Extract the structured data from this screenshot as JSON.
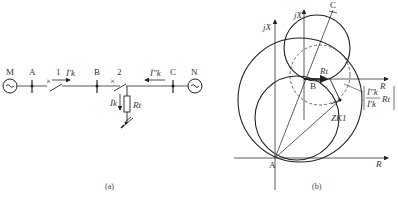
{
  "figure_a": {
    "caption": "(a)",
    "sources": [
      {
        "id": "M",
        "label": "M",
        "symbol": "~"
      },
      {
        "id": "N",
        "label": "N",
        "symbol": "~"
      }
    ],
    "buses": [
      "A",
      "B",
      "C"
    ],
    "breakers": [
      "1",
      "2"
    ],
    "currents": {
      "I_k_prime": "İ′k",
      "I_k_dprime": "İ″k",
      "I_k": "İk"
    },
    "fault_resistance": "Rt"
  },
  "figure_b": {
    "caption": "(b)",
    "axes": {
      "x_label_A": "R",
      "y_label_A": "jX",
      "x_label_B": "R",
      "y_label_B": "jX"
    },
    "points": [
      "A",
      "B",
      "C"
    ],
    "labels": {
      "Rt": "Rt",
      "Zk1": "ZK1",
      "ratio_num": "İ″k",
      "ratio_den": "İ′k",
      "ratio_tail": "Rt"
    }
  }
}
